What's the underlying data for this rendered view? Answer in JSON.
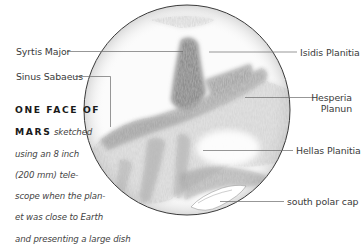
{
  "figure": {
    "subject": "Mars sketch",
    "labels": {
      "syrtis_major": "Syrtis Major",
      "sinus_sabaeus": "Sinus Sabaeus",
      "isidis_planitia": "Isidis Planitia",
      "hesperia_line1": "Hesperia",
      "hesperia_line2": "Planun",
      "hellas_planitia": "Hellas Planitia",
      "south_polar_cap": "south polar cap"
    },
    "caption": {
      "title_line1": "ONE FACE OF",
      "title_line2": "MARS",
      "line2_rest": " sketched",
      "line3": "using an 8 inch",
      "line4": "(200 mm) tele-",
      "line5": "scope when the plan-",
      "line6": "et was close to Earth",
      "line7": "and presenting a large dish"
    },
    "colors": {
      "leader_line": "#6a6a6a",
      "disc_outline": "#3a3a3a",
      "label_text": "#3a3a3a",
      "background": "#ffffff"
    }
  }
}
